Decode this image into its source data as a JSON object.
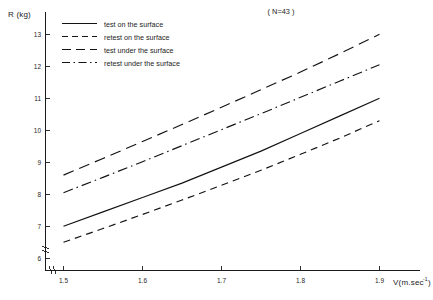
{
  "chart_data": {
    "type": "line",
    "title": "",
    "annotation": "( N=43 )",
    "xlabel": "V(m.sec",
    "xlabel_sup": "-1",
    "xlabel_tail": ")",
    "ylabel": "R (kg)",
    "xlim": [
      1.44,
      1.93
    ],
    "ylim": [
      5.62,
      13.35
    ],
    "xticks": [
      1.5,
      1.6,
      1.7,
      1.8,
      1.9
    ],
    "xtick_labels": [
      "1.5",
      "1.6",
      "1.7",
      "1.8",
      "1.9"
    ],
    "yticks": [
      6,
      7,
      8,
      9,
      10,
      11,
      12,
      13
    ],
    "ytick_labels": [
      "6",
      "7",
      "8",
      "9",
      "10",
      "11",
      "12",
      "13"
    ],
    "grid": false,
    "legend_position": "top-left-inside",
    "x": [
      1.5,
      1.55,
      1.6,
      1.65,
      1.7,
      1.75,
      1.8,
      1.85,
      1.9
    ],
    "series": [
      {
        "name": "test on the surface",
        "style": "solid",
        "values": [
          7.0,
          7.45,
          7.9,
          8.35,
          8.85,
          9.35,
          9.9,
          10.45,
          11.0
        ]
      },
      {
        "name": "retest on the surface",
        "style": "dashed-short",
        "values": [
          6.5,
          6.93,
          7.37,
          7.82,
          8.28,
          8.75,
          9.25,
          9.76,
          10.3
        ]
      },
      {
        "name": "test under the surface",
        "style": "dashed-long",
        "values": [
          8.6,
          9.12,
          9.65,
          10.18,
          10.72,
          11.27,
          11.82,
          12.4,
          13.0
        ]
      },
      {
        "name": "retest under the surface",
        "style": "dash-dot",
        "values": [
          8.05,
          8.53,
          9.02,
          9.52,
          10.02,
          10.52,
          11.03,
          11.54,
          12.05
        ]
      }
    ]
  },
  "legend": {
    "items": [
      {
        "label": "test on the surface",
        "style": "solid"
      },
      {
        "label": "retest on  the  surface",
        "style": "dashed-short"
      },
      {
        "label": "test  under  the  surface",
        "style": "dashed-long"
      },
      {
        "label": "retest  under  the  surface",
        "style": "dash-dot"
      }
    ]
  }
}
